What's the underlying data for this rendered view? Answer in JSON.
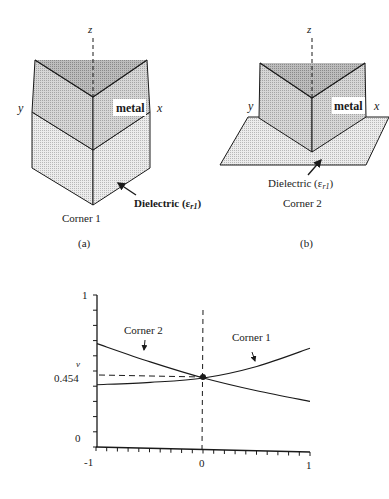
{
  "figure": {
    "panel_a": {
      "axis_z": "z",
      "axis_y": "y",
      "axis_x": "x",
      "metal_label": "metal",
      "dielectric_label": "Dielectric (ε",
      "dielectric_sub": "r1",
      "dielectric_close": ")",
      "corner_label": "Corner 1",
      "caption": "(a)"
    },
    "panel_b": {
      "axis_z": "z",
      "axis_y": "y",
      "axis_x": "x",
      "metal_label": "metal",
      "dielectric_label": "Dielectric (ε",
      "dielectric_sub": "r1",
      "dielectric_close": ")",
      "corner_label": "Corner 2",
      "caption": "(b)"
    },
    "colors": {
      "metal_top": "#9a9a9a",
      "metal_face": "#c4c4c4",
      "dielectric": "#dcdcdc",
      "line": "#1a1a1a"
    }
  },
  "chart_data": {
    "type": "line",
    "title": "",
    "xlabel": "",
    "ylabel": "v",
    "xlim": [
      -1,
      1
    ],
    "ylim": [
      0,
      1
    ],
    "x_ticks": [
      "-1",
      "0",
      "1"
    ],
    "y_ticks": [
      "0",
      "0.454",
      "1"
    ],
    "grid": false,
    "annotations": [
      {
        "text": "0.454",
        "type": "dashed-reference",
        "x": 0,
        "y": 0.454
      },
      {
        "text": "Corner 2",
        "points_to": "Corner 2"
      },
      {
        "text": "Corner 1",
        "points_to": "Corner 1"
      }
    ],
    "x": [
      -1,
      -0.5,
      0,
      0.5,
      1
    ],
    "series": [
      {
        "name": "Corner 2",
        "values": [
          0.68,
          0.56,
          0.454,
          0.37,
          0.3
        ]
      },
      {
        "name": "Corner 1",
        "values": [
          0.41,
          0.425,
          0.454,
          0.53,
          0.65
        ]
      }
    ]
  }
}
